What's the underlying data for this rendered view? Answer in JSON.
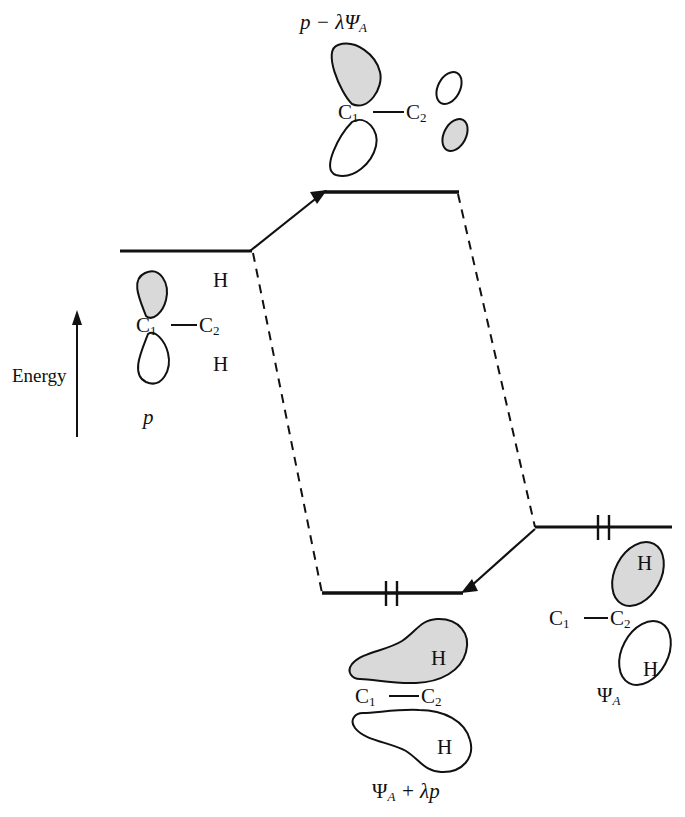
{
  "diagram": {
    "title_top": "p − λΨ",
    "title_top_sub": "A",
    "axis": {
      "label": "Energy",
      "direction": "up"
    },
    "colors": {
      "stroke": "#111111",
      "lobe_shaded_fill": "#d9d9d9",
      "lobe_empty_fill": "#ffffff",
      "background": "#ffffff"
    },
    "levels": [
      {
        "name": "reactant-p-level",
        "electrons": 0,
        "x1": 120,
        "x2": 250,
        "y": 251
      },
      {
        "name": "antibonding-level",
        "electrons": 0,
        "x1": 325,
        "x2": 458,
        "y": 192
      },
      {
        "name": "reactant-psi-level",
        "electrons": 2,
        "x1": 535,
        "x2": 672,
        "y": 527
      },
      {
        "name": "bonding-level",
        "electrons": 2,
        "x1": 322,
        "x2": 462,
        "y": 593
      }
    ],
    "correlation_lines": [
      {
        "name": "p-to-antibonding",
        "style": "arrow"
      },
      {
        "name": "p-to-bonding",
        "style": "dashed"
      },
      {
        "name": "psi-to-antibonding",
        "style": "dashed"
      },
      {
        "name": "psi-to-bonding",
        "style": "arrow"
      }
    ],
    "orbitals": {
      "top": {
        "name": "antibonding-orbital",
        "label": "p − λΨ",
        "label_sub": "A",
        "atoms": [
          "C",
          "C"
        ],
        "atom_subs": [
          "1",
          "2"
        ],
        "bond": "—",
        "lobes": [
          {
            "position": "upper-left",
            "phase": "shaded",
            "size": "large"
          },
          {
            "position": "lower-left",
            "phase": "empty",
            "size": "large"
          },
          {
            "position": "upper-right",
            "phase": "empty",
            "size": "small"
          },
          {
            "position": "lower-right",
            "phase": "shaded",
            "size": "small"
          }
        ]
      },
      "left": {
        "name": "p-orbital",
        "label": "p",
        "atoms": [
          "C",
          "C"
        ],
        "atom_subs": [
          "1",
          "2"
        ],
        "bond": "—",
        "hydrogens": [
          "H",
          "H"
        ],
        "lobes": [
          {
            "position": "above-c1",
            "phase": "shaded"
          },
          {
            "position": "below-c1",
            "phase": "empty"
          }
        ]
      },
      "right": {
        "name": "psi-a-orbital",
        "label": "Ψ",
        "label_sub": "A",
        "atoms": [
          "C",
          "C"
        ],
        "atom_subs": [
          "1",
          "2"
        ],
        "bond": "—",
        "hydrogens": [
          "H",
          "H"
        ],
        "lobes": [
          {
            "position": "upper-right",
            "phase": "shaded",
            "hydrogen": "H"
          },
          {
            "position": "lower-right",
            "phase": "empty",
            "hydrogen": "H"
          }
        ]
      },
      "bottom": {
        "name": "bonding-orbital",
        "label": "Ψ",
        "label_sub": "A",
        "label_rest": " + λp",
        "atoms": [
          "C",
          "C"
        ],
        "atom_subs": [
          "1",
          "2"
        ],
        "bond": "—",
        "hydrogens": [
          "H",
          "H"
        ],
        "lobes": [
          {
            "position": "upper",
            "phase": "shaded",
            "hydrogen": "H"
          },
          {
            "position": "lower",
            "phase": "empty",
            "hydrogen": "H"
          }
        ]
      }
    },
    "text": {
      "C": "C",
      "sub1": "1",
      "sub2": "2",
      "dash": "—",
      "H": "H",
      "p": "p",
      "psi": "Ψ",
      "subA": "A",
      "plus_lambda_p": " + λp",
      "minus_lambda_psi": "p − λΨ",
      "energy": "Energy"
    }
  }
}
